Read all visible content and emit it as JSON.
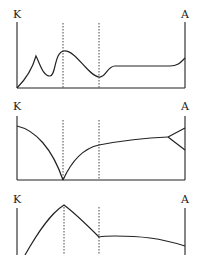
{
  "diagram": {
    "panels": [
      {
        "id": "panel-1",
        "left_label": "K",
        "right_label": "A",
        "description": "Oscillating profile: rise to small peak, dip, larger peak at first dashed line, minimum at second dashed line, plateau then rise at A"
      },
      {
        "id": "panel-2",
        "left_label": "K",
        "right_label": "A",
        "description": "Decreasing arc from K to zero at first dashed line, then increasing curve to a plateau splitting into two branches near A"
      },
      {
        "id": "panel-3",
        "left_label": "K",
        "right_label": "A",
        "description": "Rising curve peaking at first dashed line, falling to second dashed line, then slowly declining plateau toward A"
      }
    ],
    "colors": {
      "line": "#222222",
      "background": "#ffffff"
    }
  }
}
